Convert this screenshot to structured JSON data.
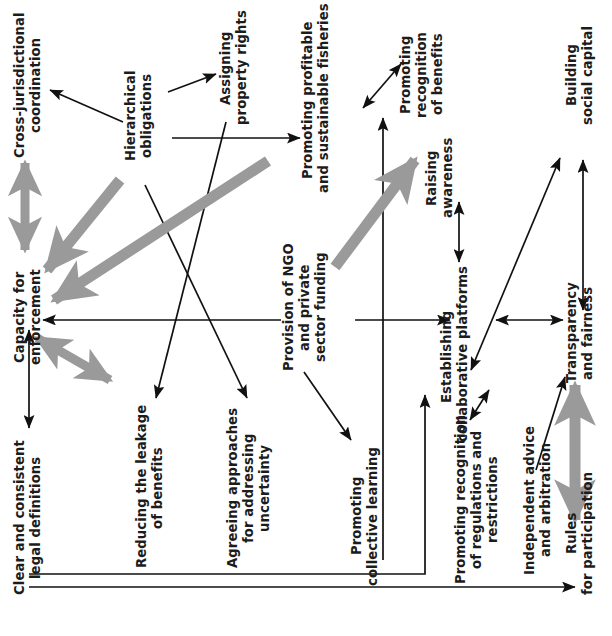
{
  "diagram": {
    "orientation": "rotated-90-ccw",
    "colors": {
      "text": "#1c1c1c",
      "thin_arrow": "#111111",
      "thick_arrow": "#9a9a9a",
      "background": "#ffffff"
    },
    "nodes": [
      {
        "id": "cross_jurisdictional_coordination",
        "label": "Cross-jurisdictional\ncoordination"
      },
      {
        "id": "capacity_for_enforcement",
        "label": "Capacity for\nenforcement"
      },
      {
        "id": "clear_and_consistent_legal_definitions",
        "label": "Clear and consistent\nlegal definitions"
      },
      {
        "id": "hierarchical_obligations",
        "label": "Hierarchical\nobligations"
      },
      {
        "id": "assigning_property_rights",
        "label": "Assigning\nproperty rights"
      },
      {
        "id": "reducing_the_leakage_of_benefits",
        "label": "Reducing the leakage\nof benefits"
      },
      {
        "id": "agreeing_approaches_for_addressing_uncertainty",
        "label": "Agreeing approaches\nfor addressing\nuncertainty"
      },
      {
        "id": "promoting_profitable_and_sustainable_fisheries",
        "label": "Promoting profitable\nand sustainable fisheries"
      },
      {
        "id": "provision_of_ngo_and_private_sector_funding",
        "label": "Provision of NGO\nand private\nsector funding"
      },
      {
        "id": "promoting_collective_learning",
        "label": "Promoting\ncollective learning"
      },
      {
        "id": "promoting_recognition_of_benefits",
        "label": "Promoting\nrecognition\nof benefits"
      },
      {
        "id": "raising_awareness",
        "label": "Raising\nawareness"
      },
      {
        "id": "establishing_collaborative_platforms",
        "label": "Establishing\ncollaborative platforms"
      },
      {
        "id": "promoting_recognition_of_regulations_and_restrictions",
        "label": "Promoting recognition\nof regulations and\nrestrictions"
      },
      {
        "id": "independent_advice_and_arbitration",
        "label": "Independent advice\nand arbitration"
      },
      {
        "id": "building_social_capital",
        "label": "Building\nsocial capital"
      },
      {
        "id": "transparency_and_fairness",
        "label": "Transparency\nand fairness"
      },
      {
        "id": "rules_for_participation",
        "label": "Rules\nfor participation"
      }
    ],
    "edges": [
      {
        "from": "hierarchical_obligations",
        "to": "cross_jurisdictional_coordination",
        "style": "thin",
        "heads": "single"
      },
      {
        "from": "hierarchical_obligations",
        "to": "assigning_property_rights",
        "style": "thin",
        "heads": "single"
      },
      {
        "from": "hierarchical_obligations",
        "to": "capacity_for_enforcement",
        "style": "thick",
        "heads": "single"
      },
      {
        "from": "hierarchical_obligations",
        "to": "agreeing_approaches_for_addressing_uncertainty",
        "style": "thin",
        "heads": "single"
      },
      {
        "from": "assigning_property_rights",
        "to": "promoting_profitable_and_sustainable_fisheries",
        "style": "thin",
        "heads": "single"
      },
      {
        "from": "assigning_property_rights",
        "to": "reducing_the_leakage_of_benefits",
        "style": "thin",
        "heads": "single"
      },
      {
        "from": "cross_jurisdictional_coordination",
        "to": "capacity_for_enforcement",
        "style": "thick",
        "heads": "double"
      },
      {
        "from": "capacity_for_enforcement",
        "to": "reducing_the_leakage_of_benefits",
        "style": "thick",
        "heads": "double"
      },
      {
        "from": "clear_and_consistent_legal_definitions",
        "to": "capacity_for_enforcement",
        "style": "thin",
        "heads": "double"
      },
      {
        "from": "provision_of_ngo_and_private_sector_funding",
        "to": "capacity_for_enforcement",
        "style": "thin",
        "heads": "single"
      },
      {
        "from": "provision_of_ngo_and_private_sector_funding",
        "to": "promoting_profitable_and_sustainable_fisheries",
        "style": "thick",
        "heads": "single"
      },
      {
        "from": "provision_of_ngo_and_private_sector_funding",
        "to": "establishing_collaborative_platforms",
        "style": "thin",
        "heads": "single"
      },
      {
        "from": "provision_of_ngo_and_private_sector_funding",
        "to": "promoting_collective_learning",
        "style": "thin",
        "heads": "single"
      },
      {
        "from": "promoting_collective_learning",
        "to": "promoting_recognition_of_benefits",
        "style": "thin",
        "heads": "single"
      },
      {
        "from": "promoting_profitable_and_sustainable_fisheries",
        "to": "promoting_recognition_of_benefits",
        "style": "thin",
        "heads": "double"
      },
      {
        "from": "establishing_collaborative_platforms",
        "to": "raising_awareness",
        "style": "thin",
        "heads": "double"
      },
      {
        "from": "establishing_collaborative_platforms",
        "to": "promoting_recognition_of_regulations_and_restrictions",
        "style": "thin",
        "heads": "double"
      },
      {
        "from": "establishing_collaborative_platforms",
        "to": "transparency_and_fairness",
        "style": "thin",
        "heads": "double"
      },
      {
        "from": "establishing_collaborative_platforms",
        "to": "building_social_capital",
        "style": "thin",
        "heads": "double"
      },
      {
        "from": "transparency_and_fairness",
        "to": "building_social_capital",
        "style": "thin",
        "heads": "double"
      },
      {
        "from": "independent_advice_and_arbitration",
        "to": "transparency_and_fairness",
        "style": "thin",
        "heads": "single"
      },
      {
        "from": "rules_for_participation",
        "to": "transparency_and_fairness",
        "style": "thick",
        "heads": "double"
      },
      {
        "from": "clear_and_consistent_legal_definitions",
        "to": "rules_for_participation",
        "style": "thin",
        "heads": "single"
      },
      {
        "from": "clear_and_consistent_legal_definitions",
        "to": "establishing_collaborative_platforms",
        "style": "thin",
        "heads": "single"
      }
    ]
  }
}
